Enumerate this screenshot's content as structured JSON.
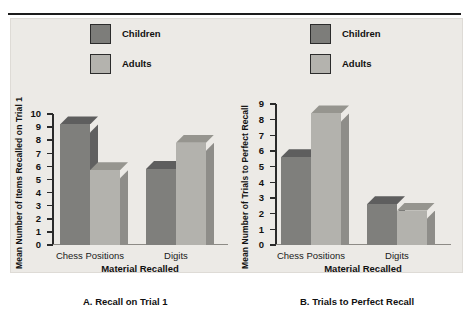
{
  "figure": {
    "background": "#eceae6",
    "colors": {
      "children": "#7f7f7c",
      "adults": "#b3b2ad",
      "axis": "#2a2a2a"
    }
  },
  "legend": {
    "children_label": "Children",
    "adults_label": "Adults"
  },
  "panel_a": {
    "caption": "A. Recall on Trial 1",
    "ylabel": "Mean Number of Items Recalled on Trial 1",
    "xlabel": "Material Recalled",
    "categories": [
      "Chess Positions",
      "Digits"
    ],
    "yticks": [
      "0",
      "1",
      "2",
      "3",
      "4",
      "5",
      "6",
      "7",
      "8",
      "9",
      "10"
    ]
  },
  "panel_b": {
    "caption": "B. Trials to Perfect Recall",
    "ylabel": "Mean Number of Trials to Perfect Recall",
    "xlabel": "Material Recalled",
    "categories": [
      "Chess Positions",
      "Digits"
    ],
    "yticks": [
      "0",
      "1",
      "2",
      "3",
      "4",
      "5",
      "6",
      "7",
      "8",
      "9"
    ]
  },
  "chart_data": [
    {
      "type": "bar",
      "title": "A. Recall on Trial 1",
      "xlabel": "Material Recalled",
      "ylabel": "Mean Number of Items Recalled on Trial 1",
      "categories": [
        "Chess Positions",
        "Digits"
      ],
      "series": [
        {
          "name": "Children",
          "values": [
            9.2,
            5.8
          ]
        },
        {
          "name": "Adults",
          "values": [
            5.7,
            7.8
          ]
        }
      ],
      "ylim": [
        0,
        10
      ],
      "ytick_step": 1,
      "grid": false,
      "legend_position": "top-center",
      "style": "3d-bars"
    },
    {
      "type": "bar",
      "title": "B. Trials to Perfect Recall",
      "xlabel": "Material Recalled",
      "ylabel": "Mean Number of Trials to Perfect Recall",
      "categories": [
        "Chess Positions",
        "Digits"
      ],
      "series": [
        {
          "name": "Children",
          "values": [
            5.6,
            2.6
          ]
        },
        {
          "name": "Adults",
          "values": [
            8.4,
            2.2
          ]
        }
      ],
      "ylim": [
        0,
        9
      ],
      "ytick_step": 1,
      "grid": false,
      "legend_position": "top-center",
      "style": "3d-bars"
    }
  ]
}
